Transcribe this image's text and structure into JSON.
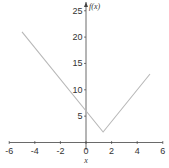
{
  "chart_data": {
    "type": "line",
    "title": "",
    "xlabel": "x",
    "ylabel": "f(x)",
    "xlim": [
      -6,
      6
    ],
    "ylim": [
      0,
      26
    ],
    "x_ticks": [
      -6,
      -4,
      -2,
      0,
      2,
      4,
      6
    ],
    "y_ticks": [
      5,
      10,
      15,
      20,
      25
    ],
    "grid": false,
    "legend": null,
    "series": [
      {
        "name": "f(x) = |3x - 4| + 2",
        "x": [
          -5,
          1.333,
          5
        ],
        "y": [
          21,
          2,
          13
        ],
        "color": "#b8b8b8"
      }
    ],
    "axis_color": "#444444"
  },
  "labels": {
    "x_axis": "x",
    "y_axis": "f(x)",
    "x_tick_labels": [
      "-6",
      "-4",
      "-2",
      "0",
      "2",
      "4",
      "6"
    ],
    "y_tick_labels": [
      "5",
      "10",
      "15",
      "20",
      "25"
    ]
  }
}
